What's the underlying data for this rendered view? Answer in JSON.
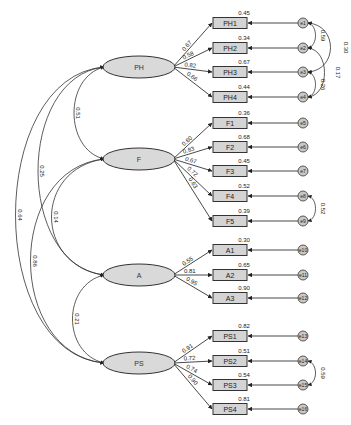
{
  "colors": {
    "latent_fill": "#d9d9d9",
    "indicator_fill": "#d4d4d4",
    "error_fill": "#c8c8c8",
    "stroke": "#333333",
    "background": "#ffffff"
  },
  "latents": [
    {
      "id": "PH",
      "label": "PH",
      "cx": 139,
      "cy": 67
    },
    {
      "id": "F",
      "label": "F",
      "cx": 139,
      "cy": 159
    },
    {
      "id": "A",
      "label": "A",
      "cx": 139,
      "cy": 275
    },
    {
      "id": "PS",
      "label": "PS",
      "cx": 139,
      "cy": 363
    }
  ],
  "indicators": [
    {
      "id": "PH1",
      "label": "PH1",
      "latent": "PH",
      "y": 23,
      "loading": "0.67",
      "r2": "0.45",
      "error": "e1"
    },
    {
      "id": "PH2",
      "label": "PH2",
      "latent": "PH",
      "y": 48,
      "loading": "0.58",
      "r2": "0.34",
      "error": "e2"
    },
    {
      "id": "PH3",
      "label": "PH3",
      "latent": "PH",
      "y": 72,
      "loading": "0.82",
      "r2": "0.67",
      "error": "e3"
    },
    {
      "id": "PH4",
      "label": "PH4",
      "latent": "PH",
      "y": 97,
      "loading": "0.66",
      "r2": "0.44",
      "error": "e4"
    },
    {
      "id": "F1",
      "label": "F1",
      "latent": "F",
      "y": 123,
      "loading": "0.60",
      "r2": "0.36",
      "error": "e5"
    },
    {
      "id": "F2",
      "label": "F2",
      "latent": "F",
      "y": 147,
      "loading": "0.83",
      "r2": "0.68",
      "error": "e6"
    },
    {
      "id": "F3",
      "label": "F3",
      "latent": "F",
      "y": 171,
      "loading": "0.67",
      "r2": "0.45",
      "error": "e7"
    },
    {
      "id": "F4",
      "label": "F4",
      "latent": "F",
      "y": 196,
      "loading": "0.72",
      "r2": "0.52",
      "error": "e8"
    },
    {
      "id": "F5",
      "label": "F5",
      "latent": "F",
      "y": 221,
      "loading": "0.63",
      "r2": "0.39",
      "error": "e9"
    },
    {
      "id": "A1",
      "label": "A1",
      "latent": "A",
      "y": 250,
      "loading": "0.55",
      "r2": "0.30",
      "error": "e10"
    },
    {
      "id": "A2",
      "label": "A2",
      "latent": "A",
      "y": 275,
      "loading": "0.81",
      "r2": "0.65",
      "error": "e11"
    },
    {
      "id": "A3",
      "label": "A3",
      "latent": "A",
      "y": 298,
      "loading": "0.95",
      "r2": "0.90",
      "error": "e12"
    },
    {
      "id": "PS1",
      "label": "PS1",
      "latent": "PS",
      "y": 336,
      "loading": "0.91",
      "r2": "0.82",
      "error": "e13"
    },
    {
      "id": "PS2",
      "label": "PS2",
      "latent": "PS",
      "y": 361,
      "loading": "0.72",
      "r2": "0.51",
      "error": "e14"
    },
    {
      "id": "PS3",
      "label": "PS3",
      "latent": "PS",
      "y": 385,
      "loading": "0.74",
      "r2": "0.54",
      "error": "e15"
    },
    {
      "id": "PS4",
      "label": "PS4",
      "latent": "PS",
      "y": 409,
      "loading": "0.90",
      "r2": "0.81",
      "error": "e16"
    }
  ],
  "latent_covariances": [
    {
      "from": "PH",
      "to": "F",
      "value": "0.51"
    },
    {
      "from": "PH",
      "to": "A",
      "value": "0.25"
    },
    {
      "from": "PH",
      "to": "PS",
      "value": "0.64"
    },
    {
      "from": "F",
      "to": "A",
      "value": "0.14"
    },
    {
      "from": "F",
      "to": "PS",
      "value": "0.86"
    },
    {
      "from": "A",
      "to": "PS",
      "value": "0.21"
    }
  ],
  "error_covariances": [
    {
      "from": "e1",
      "to": "e2",
      "value": "0.59"
    },
    {
      "from": "e1",
      "to": "e3",
      "value": "0.30"
    },
    {
      "from": "e2",
      "to": "e4",
      "value": "0.17"
    },
    {
      "from": "e3",
      "to": "e4",
      "value": "0.26"
    },
    {
      "from": "e8",
      "to": "e9",
      "value": "0.52"
    },
    {
      "from": "e14",
      "to": "e15",
      "value": "0.59"
    }
  ]
}
